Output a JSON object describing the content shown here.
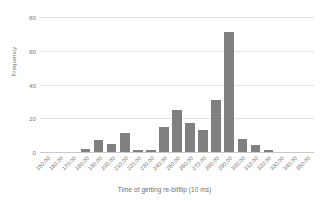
{
  "chart_data": {
    "type": "bar",
    "title": "",
    "xlabel": "Time of getting re-bitflip (10 ms)",
    "ylabel": "Frequency",
    "categories": [
      "150.00",
      "160.00",
      "170.00",
      "180.00",
      "190.00",
      "200.00",
      "210.00",
      "220.00",
      "230.00",
      "240.00",
      "250.00",
      "260.00",
      "270.00",
      "280.00",
      "290.00",
      "300.00",
      "310.00",
      "320.00",
      "330.00",
      "340.00",
      "350.00"
    ],
    "values": [
      0,
      0,
      0,
      2,
      7,
      5,
      11,
      1,
      1,
      15,
      25,
      17,
      13,
      31,
      71,
      8,
      4,
      1,
      0,
      0,
      0
    ],
    "ylim": [
      0,
      80
    ],
    "yticks": [
      "0",
      "20",
      "40",
      "60",
      "80"
    ],
    "ytick_values": [
      0,
      20,
      40,
      60,
      80
    ],
    "grid": true,
    "legend": false,
    "bar_color": "#808080",
    "grid_color": "#e4e4e4",
    "axis_text_color": "#6f6f6f"
  }
}
